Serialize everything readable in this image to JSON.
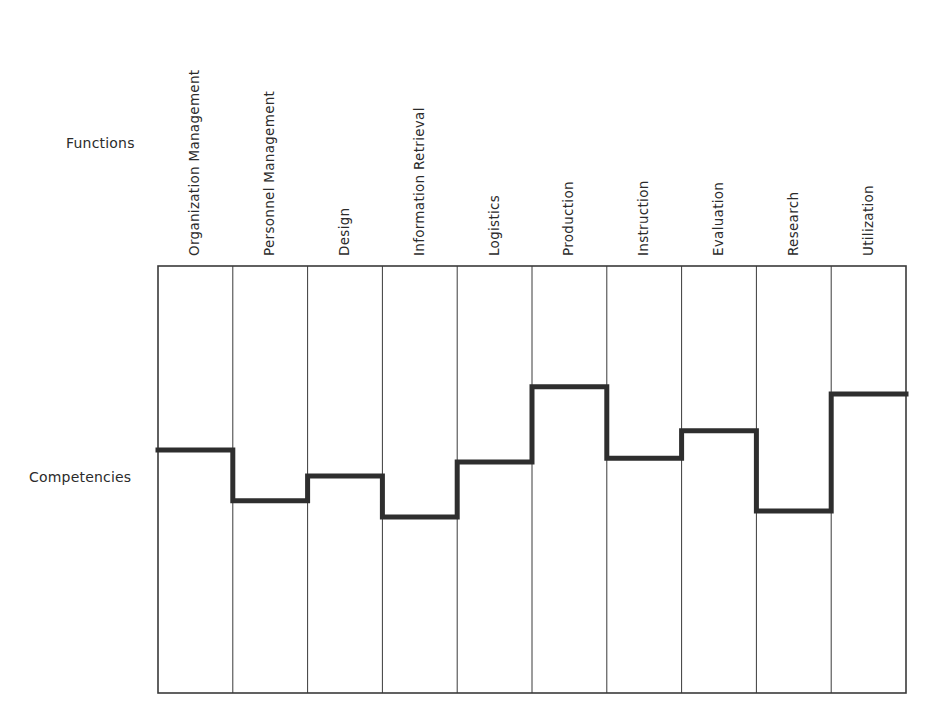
{
  "row_labels": {
    "functions": "Functions",
    "competencies": "Competencies"
  },
  "colors": {
    "grid": "#3a3a3a",
    "profile_line": "#2e2e2e",
    "text": "#2b2b2b",
    "background": "#ffffff"
  },
  "chart_data": {
    "type": "step-profile",
    "title": "",
    "xlabel": "Functions",
    "ylabel": "Competencies",
    "categories": [
      "Organization Management",
      "Personnel Management",
      "Design",
      "Information Retrieval",
      "Logistics",
      "Production",
      "Instruction",
      "Evaluation",
      "Research",
      "Utilization"
    ],
    "values": [
      56.9,
      45.0,
      50.8,
      41.2,
      54.1,
      71.7,
      55.0,
      61.4,
      42.6,
      70.0
    ],
    "ylim": [
      0,
      100
    ],
    "value_note": "Relative competency level per function, estimated from line height within grid (0 = bottom, 100 = top); no axis ticks shown",
    "grid": true,
    "legend": null
  }
}
